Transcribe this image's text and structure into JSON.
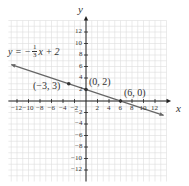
{
  "chart_data": {
    "type": "line",
    "title": "",
    "equation_label": "y = -1/3 x + 2",
    "xlabel": "x",
    "ylabel": "y",
    "xlim": [
      -14,
      14
    ],
    "ylim": [
      -14,
      14
    ],
    "grid": true,
    "x_ticks": [
      -12,
      -10,
      -8,
      -6,
      -4,
      -2,
      2,
      4,
      6,
      8,
      10,
      12
    ],
    "y_ticks": [
      12,
      10,
      8,
      6,
      4,
      2,
      -2,
      -4,
      -6,
      -8,
      -10,
      -12
    ],
    "series": [
      {
        "name": "y = -1/3 x + 2",
        "slope": -0.3333,
        "intercept": 2,
        "x": [
          -14,
          14
        ],
        "y": [
          6.667,
          -2.667
        ]
      }
    ],
    "points": [
      {
        "label": "(-3, 3)",
        "x": -3,
        "y": 3
      },
      {
        "label": "(0, 2)",
        "x": 0,
        "y": 2
      },
      {
        "label": "(6, 0)",
        "x": 6,
        "y": 0
      }
    ],
    "colors": {
      "line": "#666666",
      "grid": "#dddddd",
      "axis": "#222222",
      "point": "#333333"
    }
  },
  "labels": {
    "eq_y": "y = −",
    "eq_num": "1",
    "eq_den": "3",
    "eq_rest": "x + 2",
    "axis_x": "x",
    "axis_y": "y",
    "p1": "(−3, 3)",
    "p2": "(0, 2)",
    "p3": "(6, 0)",
    "xt": [
      "−12",
      "−10",
      "−8",
      "−6",
      "−4",
      "−2",
      "2",
      "4",
      "6",
      "8",
      "10",
      "12"
    ],
    "yt_pos": [
      "12",
      "10",
      "8",
      "6",
      "4",
      "2"
    ],
    "yt_neg": [
      "−2",
      "−4",
      "−6",
      "−8",
      "−10",
      "−12"
    ]
  }
}
